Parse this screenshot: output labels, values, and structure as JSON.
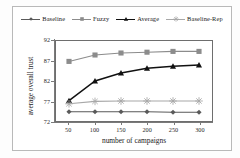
{
  "chart_data": {
    "type": "line",
    "title": "",
    "xlabel": "number of campaigns",
    "ylabel": "average overall trust",
    "x": [
      50,
      100,
      150,
      200,
      250,
      300
    ],
    "xticklabels": [
      "50",
      "100",
      "150",
      "200",
      "250",
      "300"
    ],
    "yticklabels": [
      "92",
      "87",
      "82",
      "77",
      "72"
    ],
    "yticks": [
      92,
      87,
      82,
      77,
      72
    ],
    "ylim": [
      72,
      92
    ],
    "xlim": [
      25,
      325
    ],
    "grid": false,
    "legend_position": "top",
    "series": [
      {
        "name": "Baseline",
        "marker": "diamond",
        "color": "#5a5a5a",
        "values": [
          74.3,
          74.3,
          74.3,
          74.3,
          74.2,
          74.2
        ]
      },
      {
        "name": "Fuzzy",
        "marker": "square",
        "color": "#8c8c8c",
        "values": [
          86.9,
          88.5,
          89.0,
          89.2,
          89.4,
          89.4
        ]
      },
      {
        "name": "Average",
        "marker": "triangle",
        "color": "#111111",
        "values": [
          77.1,
          82.0,
          84.0,
          85.2,
          85.7,
          86.0
        ]
      },
      {
        "name": "Baseline-Rep",
        "marker": "asterisk",
        "color": "#a8a8a8",
        "values": [
          76.3,
          76.9,
          77.0,
          77.0,
          77.0,
          77.0
        ]
      }
    ]
  },
  "colors": {
    "frame": "#b9b9b9",
    "axis": "#7a7a7a",
    "plot_border": "#6e6e6e",
    "background": "#ffffff",
    "text": "#1a1a1a"
  }
}
